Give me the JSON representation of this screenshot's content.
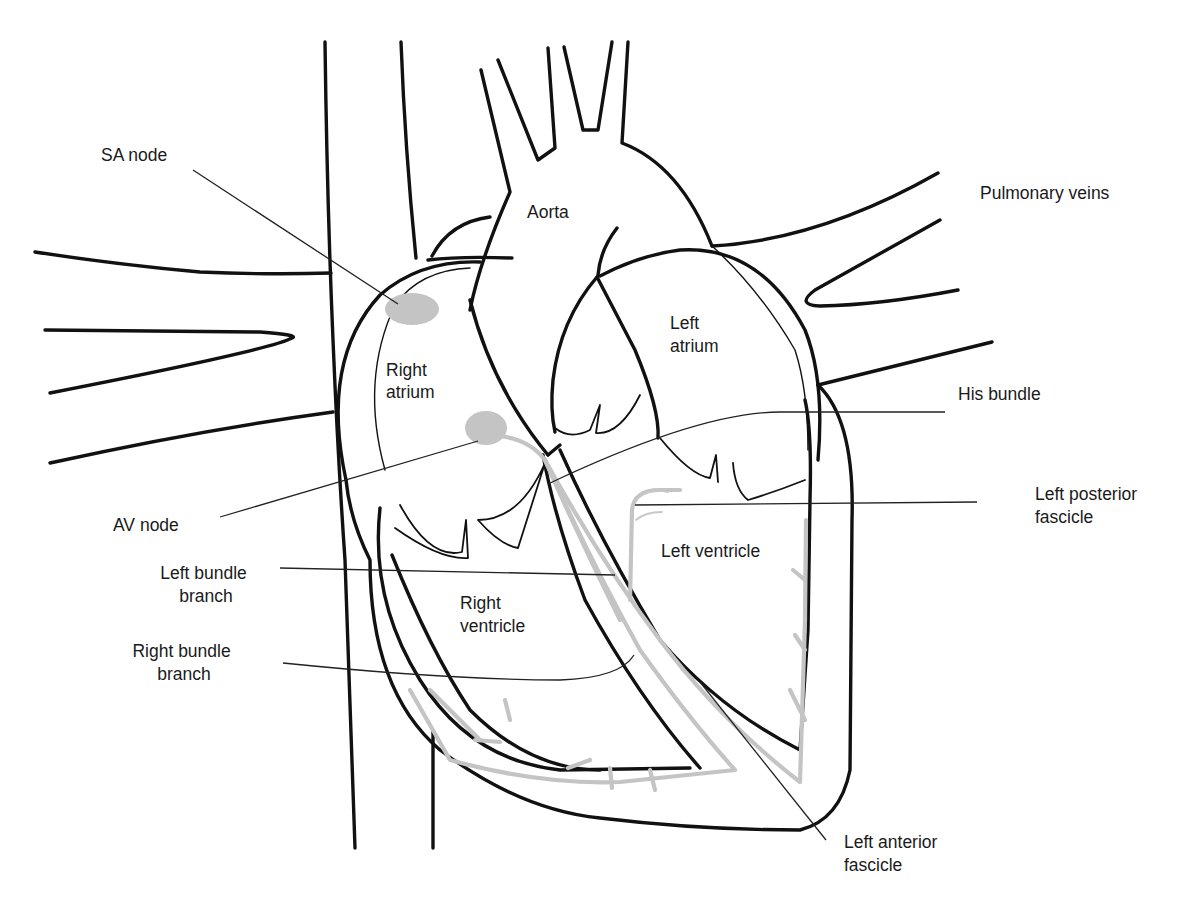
{
  "diagram": {
    "colors": {
      "outline": "#111111",
      "conduction_pathway": "#c4c4c4",
      "background": "#ffffff"
    },
    "structure_labels": {
      "aorta": "Aorta",
      "right_atrium": [
        "Right",
        "atrium"
      ],
      "left_atrium": [
        "Left",
        "atrium"
      ],
      "right_ventricle": [
        "Right",
        "ventricle"
      ],
      "left_ventricle": "Left ventricle"
    },
    "callouts": {
      "sa_node": {
        "lines": [
          "SA node"
        ]
      },
      "pulmonary_veins": {
        "lines": [
          "Pulmonary veins"
        ]
      },
      "his_bundle": {
        "lines": [
          "His bundle"
        ]
      },
      "av_node": {
        "lines": [
          "AV node"
        ]
      },
      "left_posterior_fascicle": {
        "lines": [
          "Left posterior",
          "fascicle"
        ]
      },
      "left_bundle_branch": {
        "lines": [
          "Left bundle",
          "branch"
        ]
      },
      "right_bundle_branch": {
        "lines": [
          "Right bundle",
          "branch"
        ]
      },
      "left_anterior_fascicle": {
        "lines": [
          "Left anterior",
          "fascicle"
        ]
      }
    }
  }
}
